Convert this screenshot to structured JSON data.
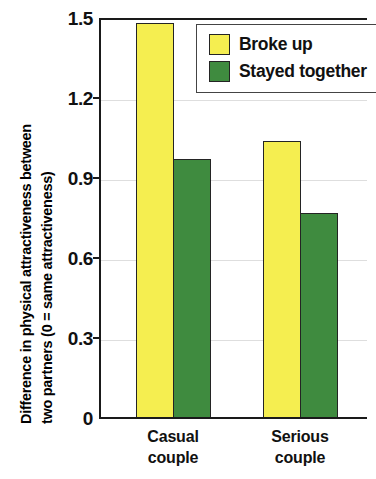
{
  "chart_data": {
    "type": "bar",
    "title": "",
    "subtitle": "",
    "xlabel": "",
    "ylabel": "Difference in physical attractiveness between two partners (0 = same attractiveness)",
    "ylabel_lines": [
      "Difference in physical attractiveness between",
      "two partners (0 = same attractiveness)"
    ],
    "categories": [
      "Casual couple",
      "Serious couple"
    ],
    "category_lines": [
      [
        "Casual",
        "couple"
      ],
      [
        "Serious",
        "couple"
      ]
    ],
    "series": [
      {
        "name": "Broke up",
        "values": [
          1.48,
          1.04
        ],
        "color": "#F5EE50"
      },
      {
        "name": "Stayed together",
        "values": [
          0.97,
          0.77
        ],
        "color": "#3F8B3F"
      }
    ],
    "ylim": [
      0,
      1.5
    ],
    "yticks": [
      0,
      0.3,
      0.6,
      0.9,
      1.2,
      1.5
    ],
    "ytick_labels": [
      "0",
      "0.3",
      "0.6",
      "0.9",
      "1.2",
      "1.5"
    ],
    "grid": true,
    "legend_position": "top-right",
    "legend_entries": [
      "Broke up",
      "Stayed together"
    ]
  },
  "colors": {
    "broke_up": "#F5EE50",
    "stayed_together": "#3F8B3F",
    "axis": "#1a1a1a",
    "grid": "#dedede",
    "bar_outline": "#242424",
    "background": "#ffffff"
  }
}
